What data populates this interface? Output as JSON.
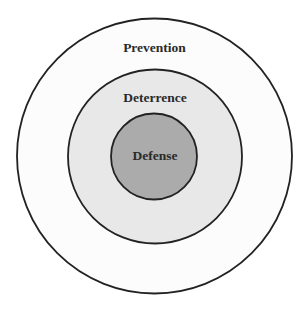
{
  "diagram": {
    "type": "concentric-circles",
    "rings": [
      {
        "id": "outer",
        "label": "Prevention",
        "fill": "#fcfcfc",
        "stroke": "#222222"
      },
      {
        "id": "middle",
        "label": "Deterrence",
        "fill": "#e8e8e8",
        "stroke": "#222222"
      },
      {
        "id": "inner",
        "label": "Defense",
        "fill": "#ababab",
        "stroke": "#222222"
      }
    ]
  }
}
